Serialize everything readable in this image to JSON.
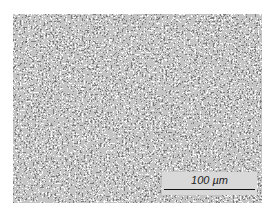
{
  "image": {
    "description": "Grayscale micrograph with fine speckled black-and-white texture",
    "colors": {
      "dark": "#1a1a1a",
      "light": "#f0f0f0",
      "mid": "#7a7a7a"
    }
  },
  "scale_bar": {
    "label": "100 µm"
  }
}
